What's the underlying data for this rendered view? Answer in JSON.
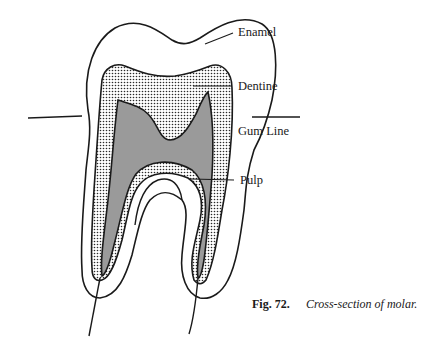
{
  "diagram": {
    "labels": {
      "enamel": "Enamel",
      "dentine": "Dentine",
      "gum_line": "Gum Line",
      "pulp": "Pulp"
    },
    "caption": {
      "number": "Fig. 72.",
      "text": "Cross-section of molar."
    },
    "colors": {
      "outline": "#1a1a1a",
      "enamel_fill": "#ffffff",
      "dentine_fill": "#dcdcdc",
      "dentine_dots": "#2a2a2a",
      "pulp_fill": "#9a9a9a",
      "background": "#ffffff"
    }
  }
}
